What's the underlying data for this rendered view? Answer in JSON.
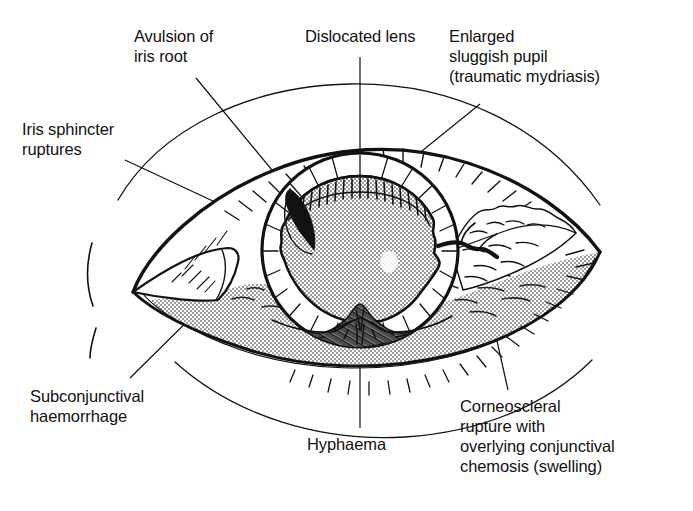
{
  "figure": {
    "background_color": "#ffffff",
    "ink_color": "#121212",
    "shade_color": "#b9b9b9",
    "labels": {
      "avulsion": "Avulsion of\niris root",
      "dislocated_lens": "Dislocated lens",
      "enlarged_pupil": "Enlarged\nsluggish pupil\n(traumatic mydriasis)",
      "iris_sphincter": "Iris sphincter\nruptures",
      "subconjunctival": "Subconjunctival\nhaemorrhage",
      "hyphaema": "Hyphaema",
      "corneoscleral": "Corneoscleral\nrupture with\noverlying conjunctival\nchemosis (swelling)"
    },
    "structures": [
      {
        "name": "upper-eyelid",
        "label": "Upper eyelid with lashes"
      },
      {
        "name": "lower-eyelid",
        "label": "Lower eyelid with lashes"
      },
      {
        "name": "brow-crease",
        "label": "Brow / lid crease arcs"
      },
      {
        "name": "cornea",
        "label": "Cornea (limbus ring)"
      },
      {
        "name": "iris",
        "label": "Iris with radiating stroma lines"
      },
      {
        "name": "pupil",
        "label": "Dilated irregular pupil (stippled)"
      },
      {
        "name": "hyphaema-blood",
        "label": "Blood layered in anterior chamber"
      },
      {
        "name": "iris-root-avulsion",
        "label": "Dark wedge of avulsed iris root"
      },
      {
        "name": "chemosis",
        "label": "Bumpy conjunctival swelling, temporal"
      },
      {
        "name": "subconjunctival-haemorrhage",
        "label": "Stippled haemorrhage over sclera"
      },
      {
        "name": "caruncle",
        "label": "Medial caruncle / inner canthus"
      },
      {
        "name": "nose-line",
        "label": "Dashed nasal profile arc"
      }
    ]
  }
}
